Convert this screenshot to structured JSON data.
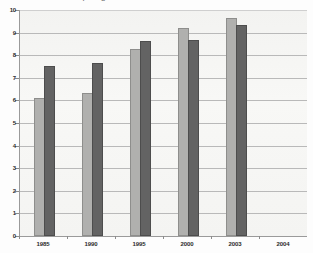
{
  "caption": {
    "sliver_text": "cut off text line at top edge of scan"
  },
  "chart_data": {
    "type": "bar",
    "title": "",
    "subtitle": "",
    "xlabel": "",
    "ylabel": "",
    "categories": [
      "1985",
      "1990",
      "1995",
      "2000",
      "2003",
      "2004"
    ],
    "series": [
      {
        "name": "series-1",
        "color": "#b0b0ae",
        "values": [
          6.0,
          6.25,
          8.2,
          9.1,
          9.55,
          null
        ]
      },
      {
        "name": "series-2",
        "color": "#636363",
        "values": [
          7.45,
          7.55,
          8.55,
          8.6,
          9.25,
          null
        ]
      }
    ],
    "ylim": [
      0,
      10
    ],
    "yticks": [
      0,
      1,
      2,
      3,
      4,
      5,
      6,
      7,
      8,
      9,
      10
    ],
    "ytick_labels": [
      "0",
      "1",
      "2",
      "3",
      "4",
      "5",
      "6",
      "7",
      "8",
      "9",
      "10"
    ],
    "grid": true,
    "grid_axis": "y",
    "legend": "none",
    "plot_background": "#f6f6f4",
    "axis_color": "#9a9a9a",
    "grid_color": "#b9b9b9"
  }
}
